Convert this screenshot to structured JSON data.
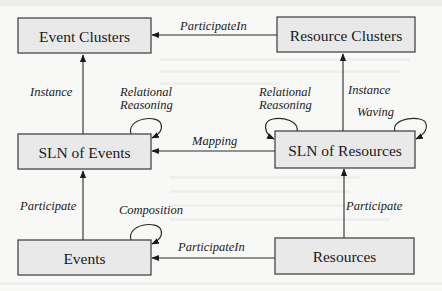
{
  "diagram": {
    "nodes": {
      "event_clusters": {
        "label": "Event Clusters"
      },
      "resource_clusters": {
        "label": "Resource Clusters"
      },
      "sln_events": {
        "label": "SLN of Events"
      },
      "sln_resources": {
        "label": "SLN of Resources"
      },
      "events": {
        "label": "Events"
      },
      "resources": {
        "label": "Resources"
      }
    },
    "edges": {
      "resource_clusters_to_event_clusters": {
        "label": "ParticipateIn",
        "from": "Resource Clusters",
        "to": "Event Clusters"
      },
      "sln_events_to_event_clusters": {
        "label": "Instance",
        "from": "SLN of Events",
        "to": "Event Clusters"
      },
      "sln_resources_to_resource_clusters": {
        "label": "Instance",
        "from": "SLN of Resources",
        "to": "Resource Clusters"
      },
      "sln_events_self": {
        "label_line1": "Relational",
        "label_line2": "Reasoning",
        "from": "SLN of Events",
        "to": "SLN of Events"
      },
      "sln_resources_self_reasoning": {
        "label_line1": "Relational",
        "label_line2": "Reasoning",
        "from": "SLN of Resources",
        "to": "SLN of Resources"
      },
      "sln_resources_self_waving": {
        "label": "Waving",
        "from": "SLN of Resources",
        "to": "SLN of Resources"
      },
      "sln_resources_to_sln_events": {
        "label": "Mapping",
        "from": "SLN of Resources",
        "to": "SLN of Events"
      },
      "events_to_sln_events": {
        "label": "Participate",
        "from": "Events",
        "to": "SLN of Events"
      },
      "resources_to_sln_resources": {
        "label": "Participate",
        "from": "Resources",
        "to": "SLN of Resources"
      },
      "events_self": {
        "label": "Composition",
        "from": "Events",
        "to": "Events"
      },
      "resources_to_events": {
        "label": "ParticipateIn",
        "from": "Resources",
        "to": "Events"
      }
    }
  }
}
